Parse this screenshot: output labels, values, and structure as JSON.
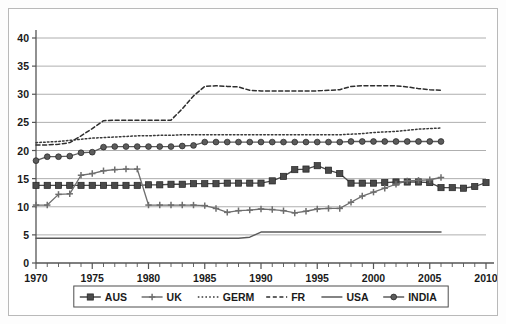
{
  "chart_data": {
    "type": "line",
    "title": "",
    "xlabel": "",
    "ylabel": "",
    "xlim": [
      1970,
      2010
    ],
    "ylim": [
      0,
      40
    ],
    "ytick_values": [
      0,
      5,
      10,
      15,
      20,
      25,
      30,
      35,
      40
    ],
    "ytick_labels": [
      "0",
      "5",
      "10",
      "15",
      "20",
      "25",
      "30",
      "35",
      "40"
    ],
    "xtick_values": [
      1970,
      1975,
      1980,
      1985,
      1990,
      1995,
      2000,
      2005,
      2010
    ],
    "xtick_labels": [
      "1970",
      "1975",
      "1980",
      "1985",
      "1990",
      "1995",
      "2000",
      "2005",
      "2010"
    ],
    "xminor_step": 1,
    "grid": "horizontal",
    "legend_position": "bottom",
    "series": [
      {
        "name": "AUS",
        "marker": "square",
        "dash": "solid",
        "color": "#4a4a4a",
        "x": [
          1970,
          1971,
          1972,
          1973,
          1974,
          1975,
          1976,
          1977,
          1978,
          1979,
          1980,
          1981,
          1982,
          1983,
          1984,
          1985,
          1986,
          1987,
          1988,
          1989,
          1990,
          1991,
          1992,
          1993,
          1994,
          1995,
          1996,
          1997,
          1998,
          1999,
          2000,
          2001,
          2002,
          2003,
          2004,
          2005,
          2006,
          2007,
          2008,
          2009,
          2010
        ],
        "values": [
          13.8,
          13.8,
          13.8,
          13.8,
          13.8,
          13.8,
          13.8,
          13.8,
          13.8,
          13.8,
          13.9,
          13.9,
          14.0,
          14.0,
          14.1,
          14.1,
          14.1,
          14.2,
          14.2,
          14.2,
          14.2,
          14.6,
          15.4,
          16.6,
          16.7,
          17.3,
          16.5,
          15.9,
          14.2,
          14.2,
          14.2,
          14.3,
          14.4,
          14.4,
          14.4,
          14.3,
          13.4,
          13.4,
          13.3,
          13.6,
          14.3
        ]
      },
      {
        "name": "UK",
        "marker": "plus",
        "dash": "solid",
        "color": "#6e6e6e",
        "x": [
          1970,
          1971,
          1972,
          1973,
          1974,
          1975,
          1976,
          1977,
          1978,
          1979,
          1980,
          1981,
          1982,
          1983,
          1984,
          1985,
          1986,
          1987,
          1988,
          1989,
          1990,
          1991,
          1992,
          1993,
          1994,
          1995,
          1996,
          1997,
          1998,
          1999,
          2000,
          2001,
          2002,
          2003,
          2004,
          2005,
          2006
        ],
        "values": [
          10.3,
          10.3,
          12.2,
          12.3,
          15.6,
          15.9,
          16.4,
          16.6,
          16.7,
          16.7,
          10.3,
          10.3,
          10.3,
          10.3,
          10.3,
          10.2,
          9.7,
          9.0,
          9.3,
          9.4,
          9.6,
          9.5,
          9.3,
          8.9,
          9.2,
          9.6,
          9.7,
          9.7,
          10.8,
          11.9,
          12.6,
          13.3,
          14.0,
          14.6,
          14.7,
          14.8,
          15.2
        ]
      },
      {
        "name": "GERM",
        "marker": "none",
        "dash": "dotted",
        "color": "#3a3a3a",
        "x": [
          1970,
          1971,
          1972,
          1973,
          1974,
          1975,
          1976,
          1977,
          1978,
          1979,
          1980,
          1981,
          1982,
          1983,
          1984,
          1985,
          1986,
          1987,
          1988,
          1989,
          1990,
          1991,
          1992,
          1993,
          1994,
          1995,
          1996,
          1997,
          1998,
          1999,
          2000,
          2001,
          2002,
          2003,
          2004,
          2005,
          2006
        ],
        "values": [
          21.4,
          21.5,
          21.6,
          21.8,
          22.0,
          22.2,
          22.3,
          22.4,
          22.5,
          22.6,
          22.6,
          22.7,
          22.7,
          22.8,
          22.8,
          22.8,
          22.8,
          22.8,
          22.8,
          22.8,
          22.8,
          22.8,
          22.8,
          22.8,
          22.8,
          22.8,
          22.8,
          22.8,
          22.9,
          23.0,
          23.2,
          23.3,
          23.4,
          23.6,
          23.8,
          23.9,
          24.0
        ]
      },
      {
        "name": "FR",
        "marker": "none",
        "dash": "dashed",
        "color": "#2e2e2e",
        "x": [
          1970,
          1971,
          1972,
          1973,
          1974,
          1975,
          1976,
          1977,
          1978,
          1979,
          1980,
          1981,
          1982,
          1983,
          1984,
          1985,
          1986,
          1987,
          1988,
          1989,
          1990,
          1991,
          1992,
          1993,
          1994,
          1995,
          1996,
          1997,
          1998,
          1999,
          2000,
          2001,
          2002,
          2003,
          2004,
          2005,
          2006
        ],
        "values": [
          21.0,
          21.0,
          21.1,
          21.4,
          22.6,
          23.9,
          25.3,
          25.4,
          25.4,
          25.4,
          25.4,
          25.4,
          25.4,
          27.4,
          29.7,
          31.4,
          31.5,
          31.4,
          31.3,
          30.7,
          30.6,
          30.6,
          30.6,
          30.6,
          30.6,
          30.6,
          30.7,
          30.8,
          31.4,
          31.5,
          31.5,
          31.5,
          31.5,
          31.3,
          31.0,
          30.8,
          30.7
        ]
      },
      {
        "name": "USA",
        "marker": "none",
        "dash": "solid",
        "color": "#5a5a5a",
        "x": [
          1970,
          1975,
          1980,
          1985,
          1988,
          1989,
          1990,
          1995,
          2000,
          2005,
          2006
        ],
        "values": [
          4.4,
          4.4,
          4.4,
          4.4,
          4.4,
          4.6,
          5.5,
          5.5,
          5.5,
          5.5,
          5.5
        ]
      },
      {
        "name": "INDIA",
        "marker": "circle",
        "dash": "solid",
        "color": "#5c5c5c",
        "x": [
          1970,
          1971,
          1972,
          1973,
          1974,
          1975,
          1976,
          1977,
          1978,
          1979,
          1980,
          1981,
          1982,
          1983,
          1984,
          1985,
          1986,
          1987,
          1988,
          1989,
          1990,
          1991,
          1992,
          1993,
          1994,
          1995,
          1996,
          1997,
          1998,
          1999,
          2000,
          2001,
          2002,
          2003,
          2004,
          2005,
          2006
        ],
        "values": [
          18.2,
          18.9,
          18.9,
          19.0,
          19.6,
          19.7,
          20.6,
          20.7,
          20.7,
          20.7,
          20.7,
          20.7,
          20.7,
          20.8,
          20.9,
          21.5,
          21.5,
          21.5,
          21.5,
          21.5,
          21.5,
          21.5,
          21.5,
          21.5,
          21.5,
          21.5,
          21.5,
          21.5,
          21.6,
          21.6,
          21.6,
          21.6,
          21.6,
          21.6,
          21.6,
          21.6,
          21.6
        ]
      }
    ]
  },
  "legend": {
    "entries": [
      {
        "label": "AUS"
      },
      {
        "label": "UK"
      },
      {
        "label": "GERM"
      },
      {
        "label": "FR"
      },
      {
        "label": "USA"
      },
      {
        "label": "INDIA"
      }
    ]
  },
  "colors": {
    "background": "#ffffff",
    "frame_border": "#b9b9b9",
    "gridline": "#9a9a9a",
    "axis": "#555555",
    "text": "#1a1a1a"
  }
}
